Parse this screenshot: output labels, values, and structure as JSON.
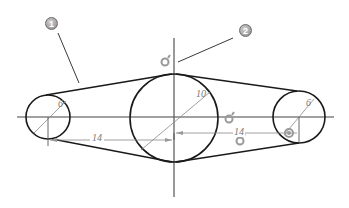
{
  "diagram": {
    "callouts": [
      {
        "label": "1",
        "target": "belt-outline"
      },
      {
        "label": "2",
        "target": "constraint-icon"
      }
    ],
    "dimensions": {
      "left_circle_diameter": "6",
      "center_circle_radius": "10",
      "right_circle_diameter": "6",
      "left_distance": "14",
      "right_distance": "14"
    },
    "colors": {
      "outline": "#1a1a1a",
      "construction": "#555555",
      "dimension": "#888888",
      "constraint_icon": "#9a9a9a",
      "callout": "#8a8a8a"
    }
  }
}
